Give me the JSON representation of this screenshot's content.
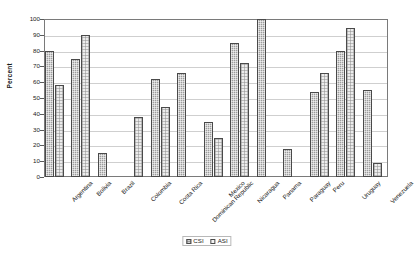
{
  "chart_data": {
    "type": "bar",
    "title": "",
    "xlabel": "",
    "ylabel": "Percent",
    "ylim": [
      0,
      100
    ],
    "ytick_step": 10,
    "yticks": [
      100,
      90,
      80,
      70,
      60,
      50,
      40,
      30,
      20,
      10,
      0
    ],
    "grid": true,
    "legend_position": "bottom-center",
    "categories": [
      "Argentina",
      "Bolivia",
      "Brazil",
      "Colombia",
      "Costa Rica",
      "Dominican Republic",
      "Mexico",
      "Nicaragua",
      "Panama",
      "Paraguay",
      "Peru",
      "Uruguay",
      "Venezuela"
    ],
    "series": [
      {
        "name": "CSI",
        "values": [
          80,
          75,
          15,
          0,
          62,
          66,
          35,
          85,
          100,
          18,
          54,
          80,
          55
        ]
      },
      {
        "name": "ASI",
        "values": [
          58,
          90,
          0,
          38,
          44,
          0,
          25,
          72,
          0,
          0,
          66,
          94,
          9
        ]
      }
    ]
  },
  "axis": {
    "y_title": "Percent"
  },
  "legend": {
    "items": [
      {
        "label": "CSI",
        "swatch": "csi-swatch-icon"
      },
      {
        "label": "ASI",
        "swatch": "asi-swatch-icon"
      }
    ]
  }
}
